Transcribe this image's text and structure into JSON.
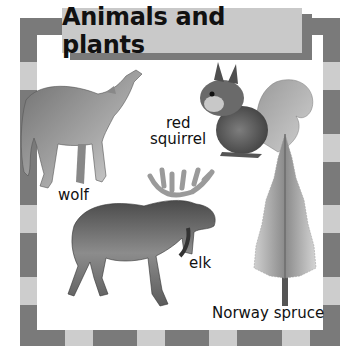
{
  "title": "Animals and plants",
  "colors": {
    "border_dark": "#7a7a7a",
    "border_light": "#cdcdcd",
    "banner_fill": "#c9c9c9",
    "banner_shadow": "#7a7a7a",
    "background": "#ffffff",
    "text": "#111111"
  },
  "labels": {
    "wolf": "wolf",
    "red_squirrel_line1": "red",
    "red_squirrel_line2": "squirrel",
    "elk": "elk",
    "norway_spruce": "Norway spruce"
  },
  "illustrations": [
    {
      "name": "wolf",
      "pose": "howling"
    },
    {
      "name": "red squirrel",
      "pose": "sitting, eating"
    },
    {
      "name": "elk",
      "pose": "walking"
    },
    {
      "name": "Norway spruce",
      "pose": "tree"
    }
  ]
}
